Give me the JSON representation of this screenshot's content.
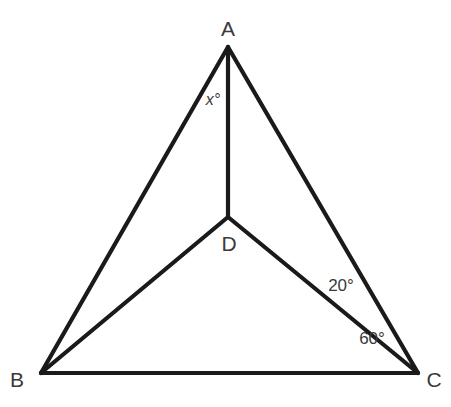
{
  "figure": {
    "type": "geometry-diagram",
    "shape": "triangle-with-interior-point",
    "background_color": "#ffffff",
    "stroke_color": "#1a1a1a",
    "stroke_width": 4.2,
    "text_color": "#3a3a3a",
    "width": 451,
    "height": 407
  },
  "points": {
    "A": {
      "label": "A",
      "x": 228,
      "y": 47,
      "label_x": 228,
      "label_y": 28
    },
    "B": {
      "label": "B",
      "x": 41,
      "y": 373,
      "label_x": 17,
      "label_y": 379
    },
    "C": {
      "label": "C",
      "x": 418,
      "y": 373,
      "label_x": 434,
      "label_y": 379
    },
    "D": {
      "label": "D",
      "x": 228,
      "y": 217,
      "label_x": 229,
      "label_y": 243
    }
  },
  "segments": [
    {
      "name": "AB",
      "from": "A",
      "to": "B",
      "x1": 228,
      "y1": 47,
      "x2": 41,
      "y2": 373
    },
    {
      "name": "AC",
      "from": "A",
      "to": "C",
      "x1": 228,
      "y1": 47,
      "x2": 418,
      "y2": 373
    },
    {
      "name": "BC",
      "from": "B",
      "to": "C",
      "x1": 41,
      "y1": 373,
      "x2": 418,
      "y2": 373
    },
    {
      "name": "AD",
      "from": "A",
      "to": "D",
      "x1": 228,
      "y1": 47,
      "x2": 228,
      "y2": 217
    },
    {
      "name": "BD",
      "from": "B",
      "to": "D",
      "x1": 41,
      "y1": 373,
      "x2": 228,
      "y2": 217
    },
    {
      "name": "DC",
      "from": "D",
      "to": "C",
      "x1": 228,
      "y1": 217,
      "x2": 418,
      "y2": 373
    }
  ],
  "angles": [
    {
      "name": "angle-x",
      "text": "x°",
      "x": 213,
      "y": 100,
      "style": "italic",
      "at_vertex": "A",
      "between": "AB-AD"
    },
    {
      "name": "angle-dca",
      "text": "20°",
      "x": 341,
      "y": 285,
      "style": "normal",
      "at_vertex": "C",
      "between": "DC-AC"
    },
    {
      "name": "angle-dcb",
      "text": "60°",
      "x": 372,
      "y": 338,
      "style": "normal",
      "at_vertex": "C",
      "between": "BC-DC"
    }
  ]
}
